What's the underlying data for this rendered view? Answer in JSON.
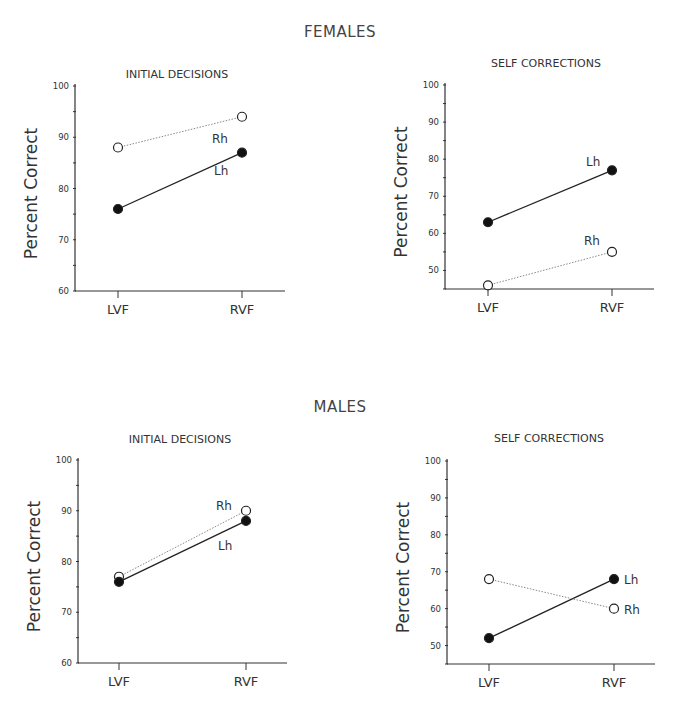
{
  "sections": [
    {
      "title": "FEMALES"
    },
    {
      "title": "MALES"
    }
  ],
  "chart_data": [
    {
      "type": "line",
      "group": "FEMALES",
      "title": "INITIAL DECISIONS",
      "xlabel": "",
      "ylabel": "Percent Correct",
      "categories": [
        "LVF",
        "RVF"
      ],
      "ylim": [
        60,
        100
      ],
      "yticks": [
        60,
        70,
        80,
        90,
        100
      ],
      "series": [
        {
          "name": "Rh",
          "marker": "open-circle",
          "line": "dotted",
          "values": [
            88,
            94
          ]
        },
        {
          "name": "Lh",
          "marker": "filled-circle",
          "line": "solid",
          "values": [
            76,
            87
          ]
        }
      ],
      "grid": false,
      "legend": "inline labels"
    },
    {
      "type": "line",
      "group": "FEMALES",
      "title": "SELF CORRECTIONS",
      "xlabel": "",
      "ylabel": "Percent Correct",
      "categories": [
        "LVF",
        "RVF"
      ],
      "ylim": [
        45,
        100
      ],
      "yticks": [
        50,
        60,
        70,
        80,
        90,
        100
      ],
      "series": [
        {
          "name": "Lh",
          "marker": "filled-circle",
          "line": "solid",
          "values": [
            63,
            77
          ]
        },
        {
          "name": "Rh",
          "marker": "open-circle",
          "line": "dotted",
          "values": [
            46,
            55
          ]
        }
      ],
      "grid": false,
      "legend": "inline labels"
    },
    {
      "type": "line",
      "group": "MALES",
      "title": "INITIAL DECISIONS",
      "xlabel": "",
      "ylabel": "Percent Correct",
      "categories": [
        "LVF",
        "RVF"
      ],
      "ylim": [
        60,
        100
      ],
      "yticks": [
        60,
        70,
        80,
        90,
        100
      ],
      "series": [
        {
          "name": "Rh",
          "marker": "open-circle",
          "line": "dotted",
          "values": [
            77,
            90
          ]
        },
        {
          "name": "Lh",
          "marker": "filled-circle",
          "line": "solid",
          "values": [
            76,
            88
          ]
        }
      ],
      "grid": false,
      "legend": "inline labels"
    },
    {
      "type": "line",
      "group": "MALES",
      "title": "SELF CORRECTIONS",
      "xlabel": "",
      "ylabel": "Percent Correct",
      "categories": [
        "LVF",
        "RVF"
      ],
      "ylim": [
        45,
        100
      ],
      "yticks": [
        50,
        60,
        70,
        80,
        90,
        100
      ],
      "series": [
        {
          "name": "Lh",
          "marker": "filled-circle",
          "line": "solid",
          "values": [
            52,
            68
          ]
        },
        {
          "name": "Rh",
          "marker": "open-circle",
          "line": "dotted",
          "values": [
            68,
            60
          ]
        }
      ],
      "grid": false,
      "legend": "inline labels"
    }
  ]
}
